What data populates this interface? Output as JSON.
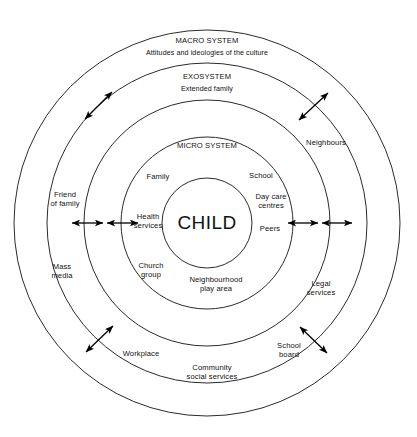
{
  "diagram": {
    "type": "concentric-circles",
    "center": {
      "x": 207,
      "y": 223
    },
    "core": {
      "label": "CHILD",
      "radius": 45
    },
    "rings": [
      {
        "id": "macro",
        "name": "MACRO SYSTEM",
        "subtitle": "Attitudes and ideologies of the culture",
        "radius": 193,
        "label_x": 207,
        "label_y": 41,
        "sub_x": 207,
        "sub_y": 54
      },
      {
        "id": "exo",
        "name": "EXOSYSTEM",
        "subtitle": "Extended family",
        "radius": 160,
        "label_x": 207,
        "label_y": 77,
        "sub_x": 207,
        "sub_y": 90
      },
      {
        "id": "meso",
        "name": "",
        "subtitle": "",
        "radius": 123,
        "label_x": 0,
        "label_y": 0,
        "sub_x": 0,
        "sub_y": 0
      },
      {
        "id": "micro",
        "name": "MICRO SYSTEM",
        "subtitle": "",
        "radius": 86,
        "label_x": 207,
        "label_y": 146,
        "sub_x": 0,
        "sub_y": 0
      }
    ],
    "nodes": [
      {
        "id": "family",
        "label": "Family",
        "x": 158,
        "y": 177
      },
      {
        "id": "school",
        "label": "School",
        "x": 261,
        "y": 176
      },
      {
        "id": "day-care",
        "label": "Day care\ncentres",
        "x": 271,
        "y": 201
      },
      {
        "id": "health",
        "label": "Health\nservices",
        "x": 148,
        "y": 221
      },
      {
        "id": "peers",
        "label": "Peers",
        "x": 270,
        "y": 229
      },
      {
        "id": "church",
        "label": "Church\ngroup",
        "x": 151,
        "y": 270
      },
      {
        "id": "neighbourhood",
        "label": "Neighbourhood\nplay area",
        "x": 216,
        "y": 284
      },
      {
        "id": "friend",
        "label": "Friend\nof family",
        "x": 65,
        "y": 199
      },
      {
        "id": "mass-media",
        "label": "Mass\nmedia",
        "x": 62,
        "y": 271
      },
      {
        "id": "neighbours",
        "label": "Neighbours",
        "x": 326,
        "y": 143
      },
      {
        "id": "legal",
        "label": "Legal\nservices",
        "x": 321,
        "y": 288
      },
      {
        "id": "workplace",
        "label": "Workplace",
        "x": 141,
        "y": 354
      },
      {
        "id": "school-board",
        "label": "School\nboard",
        "x": 289,
        "y": 350
      },
      {
        "id": "community",
        "label": "Community\nsocial services",
        "x": 212,
        "y": 372
      }
    ],
    "arrows": [
      {
        "id": "arrow-left-outer",
        "x1": 72,
        "y1": 223,
        "x2": 103,
        "y2": 223
      },
      {
        "id": "arrow-left-inner",
        "x1": 107,
        "y1": 223,
        "x2": 138,
        "y2": 223
      },
      {
        "id": "arrow-right-inner",
        "x1": 288,
        "y1": 223,
        "x2": 318,
        "y2": 223
      },
      {
        "id": "arrow-right-outer",
        "x1": 322,
        "y1": 223,
        "x2": 352,
        "y2": 223
      },
      {
        "id": "arrow-upper-left",
        "x1": 85,
        "y1": 119,
        "x2": 112,
        "y2": 92
      },
      {
        "id": "arrow-upper-right",
        "x1": 299,
        "y1": 120,
        "x2": 328,
        "y2": 93
      },
      {
        "id": "arrow-lower-left",
        "x1": 86,
        "y1": 352,
        "x2": 113,
        "y2": 326
      },
      {
        "id": "arrow-lower-right",
        "x1": 327,
        "y1": 353,
        "x2": 300,
        "y2": 327
      }
    ]
  },
  "colors": {
    "stroke": "#2b2b2b",
    "text": "#111111",
    "background": "#ffffff"
  }
}
